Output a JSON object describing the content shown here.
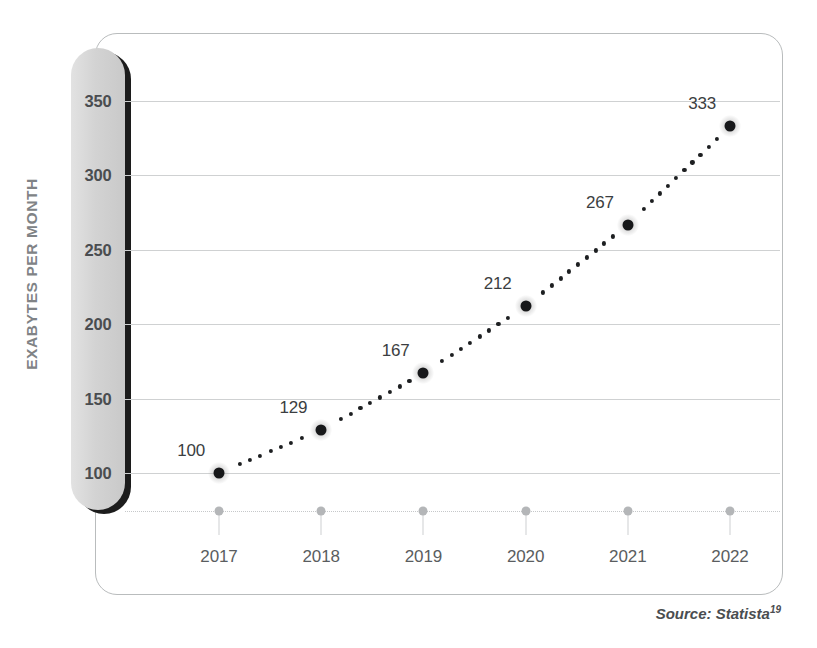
{
  "chart_data": {
    "type": "line",
    "title": "",
    "subtitle": "",
    "xlabel": "",
    "ylabel": "EXABYTES PER MONTH",
    "categories": [
      "2017",
      "2018",
      "2019",
      "2020",
      "2021",
      "2022"
    ],
    "x": [
      2017,
      2018,
      2019,
      2020,
      2021,
      2022
    ],
    "values": [
      100,
      129,
      167,
      212,
      267,
      333
    ],
    "point_labels": [
      "100",
      "129",
      "167",
      "212",
      "267",
      "333"
    ],
    "series": [
      {
        "name": "Mobile data traffic",
        "values": [
          100,
          129,
          167,
          212,
          267,
          333
        ],
        "marker": "circle",
        "linestyle": "dotted",
        "color": "#17181a"
      }
    ],
    "yticks": [
      350,
      300,
      250,
      200,
      150,
      100
    ],
    "ytick_labels": [
      "350",
      "300",
      "250",
      "200",
      "150",
      "100"
    ],
    "ylim": [
      75,
      350
    ],
    "grid": "horizontal",
    "legend": "none",
    "annotations": [
      "Source: Statista19"
    ]
  },
  "axis": {
    "y_title": "EXABYTES PER MONTH",
    "y_tick_labels": [
      "350",
      "300",
      "250",
      "200",
      "150",
      "100"
    ],
    "x_tick_labels": [
      "2017",
      "2018",
      "2019",
      "2020",
      "2021",
      "2022"
    ]
  },
  "footer": {
    "source_prefix": "Source: Statista",
    "source_superscript": "19"
  },
  "colors": {
    "marker": "#17181a",
    "gridline": "#cfd1d2",
    "axis_band": "#d3d3d3",
    "axis_band_shadow": "#1c1c1c",
    "y_title": "#808386",
    "tick_text": "#4a4d50",
    "x_marker": "#b4b6b8",
    "frame": "#b9bcbd"
  }
}
